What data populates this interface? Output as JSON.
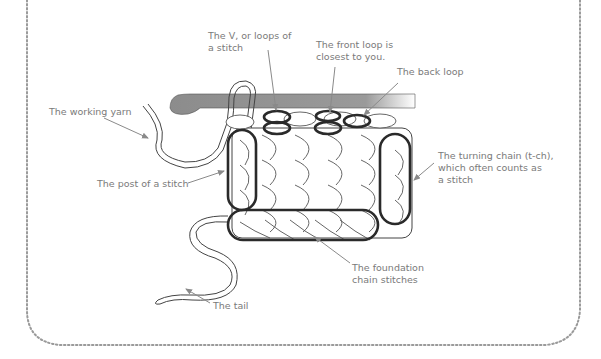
{
  "diagram": {
    "type": "crochet-stitch-anatomy",
    "colors": {
      "label_text": "#7a7a7a",
      "leader_line": "#8a8a8a",
      "outline": "#333333",
      "hook": "#8c8c8c",
      "border_dots": "#9a9a9a"
    },
    "labels": {
      "v_loops": {
        "line1": "The V, or loops of",
        "line2": "a stitch"
      },
      "front_loop": {
        "line1": "The front loop is",
        "line2": "closest to you."
      },
      "back_loop": {
        "line1": "The back loop"
      },
      "working_yarn": {
        "line1": "The working yarn"
      },
      "post": {
        "line1": "The post of a stitch"
      },
      "turning_chain": {
        "line1": "The turning chain (t-ch),",
        "line2": "which often counts as",
        "line3": "a stitch"
      },
      "foundation": {
        "line1": "The foundation",
        "line2": "chain stitches"
      },
      "tail": {
        "line1": "The tail"
      }
    }
  }
}
